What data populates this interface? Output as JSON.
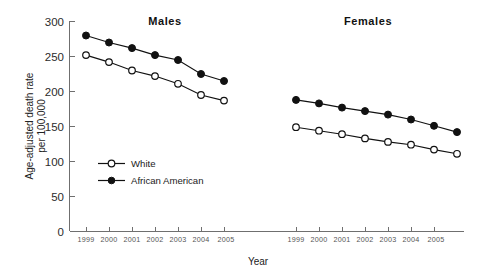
{
  "chart_data": {
    "type": "line",
    "title": "",
    "xlabel": "Year",
    "ylabel": "Age-adjusted death rate per 100,000",
    "ylim": [
      0,
      300
    ],
    "ytick_labels": [
      "0",
      "50",
      "100",
      "150",
      "200",
      "250",
      "300"
    ],
    "ytick_values": [
      0,
      50,
      100,
      150,
      200,
      250,
      300
    ],
    "grid": false,
    "legend_position": "inside-left",
    "panels": [
      {
        "name": "males-panel",
        "title": "Males",
        "categories": [
          "1999",
          "2000",
          "2001",
          "2002",
          "2003",
          "2004",
          "2005"
        ],
        "series": [
          {
            "name": "African American",
            "marker": "filled-circle",
            "values": [
              280,
              270,
              262,
              252,
              245,
              225,
              215
            ]
          },
          {
            "name": "White",
            "marker": "open-circle",
            "values": [
              252,
              242,
              230,
              222,
              211,
              195,
              187
            ]
          }
        ]
      },
      {
        "name": "females-panel",
        "title": "Females",
        "categories": [
          "1999",
          "2000",
          "2001",
          "2002",
          "2003",
          "2004",
          "2005"
        ],
        "series": [
          {
            "name": "African American",
            "marker": "filled-circle",
            "values": [
              188,
              183,
              177,
              172,
              167,
              160,
              151,
              142
            ]
          },
          {
            "name": "White",
            "marker": "open-circle",
            "values": [
              149,
              144,
              139,
              133,
              128,
              124,
              117,
              111
            ]
          }
        ]
      }
    ],
    "legend": [
      {
        "label": "White",
        "marker": "open-circle"
      },
      {
        "label": "African American",
        "marker": "filled-circle"
      }
    ],
    "colors": {
      "line": "#111111",
      "axis": "#6f6f6f",
      "background": "#ffffff"
    }
  },
  "axis": {
    "y_title_line1": "Age-adjusted death rate",
    "y_title_line2": "per 100,000",
    "x_title": "Year"
  },
  "panels": {
    "males": {
      "title": "Males"
    },
    "females": {
      "title": "Females"
    }
  },
  "legend": {
    "white": "White",
    "african_american": "African American"
  },
  "yticks": {
    "t0": "0",
    "t50": "50",
    "t100": "100",
    "t150": "150",
    "t200": "200",
    "t250": "250",
    "t300": "300"
  },
  "xticks_males": {
    "y1999": "1999",
    "y2000": "2000",
    "y2001": "2001",
    "y2002": "2002",
    "y2003": "2003",
    "y2004": "2004",
    "y2005": "2005"
  },
  "xticks_females": {
    "y1999": "1999",
    "y2000": "2000",
    "y2001": "2001",
    "y2002": "2002",
    "y2003": "2003",
    "y2004": "2004",
    "y2005": "2005"
  }
}
